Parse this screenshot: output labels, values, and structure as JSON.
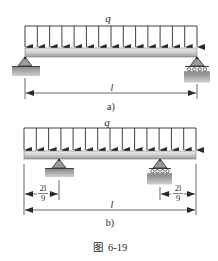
{
  "figure": {
    "caption": "图  6-19",
    "colors": {
      "line": "#2a2a2a",
      "beam_top": "#e6e6e6",
      "beam_bottom": "#9a9a9a",
      "support": "#8c8c8c",
      "ground": "#a9a9a9"
    },
    "panels": [
      {
        "id": "a",
        "label": "a)",
        "load_label": "q",
        "span_label": "l",
        "supports": [
          {
            "type": "pin",
            "position": "left end"
          },
          {
            "type": "roller",
            "position": "right end"
          }
        ]
      },
      {
        "id": "b",
        "label": "b)",
        "load_label": "q",
        "span_label": "l",
        "overhang_left": {
          "num": "2l",
          "den": "9"
        },
        "overhang_right": {
          "num": "2l",
          "den": "9"
        },
        "supports": [
          {
            "type": "pin",
            "position": "2l/9 from left end"
          },
          {
            "type": "roller",
            "position": "2l/9 from right end"
          }
        ]
      }
    ]
  }
}
